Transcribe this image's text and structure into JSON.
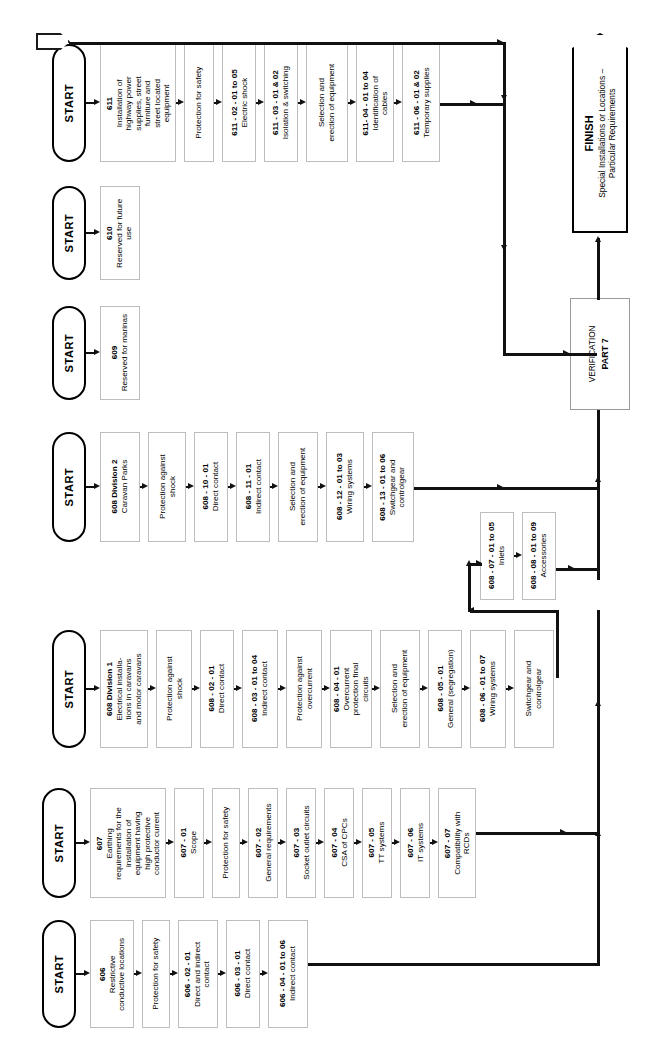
{
  "meta": {
    "start_label": "START"
  },
  "flag": {
    "label": ""
  },
  "finish": {
    "title": "FINISH",
    "subtitle": "Special Installations or Locations –\nParticular Requirements",
    "subtitle_line1": "Special Installations or Locations –",
    "subtitle_line2": "Particular Requirements"
  },
  "verification": {
    "line1": "VERIFICATION",
    "line2": "PART 7"
  },
  "rows": [
    {
      "id": "row-611",
      "start": "START",
      "boxes": [
        {
          "code": "611",
          "text": "Installation of\nhighway power\nsupplies, street\nfurniture and\nstreet located\nequipment",
          "lines": [
            "Installation of",
            "highway power",
            "supplies, street",
            "furniture and",
            "street located",
            "equipment"
          ]
        },
        {
          "code": "",
          "text": "Protection for safety",
          "lines": [
            "Protection for safety"
          ]
        },
        {
          "code": "611 - 02 - 01 to 05",
          "code_pre": "611 - 02 - 01",
          "code_mid": "to",
          "code_post": "05",
          "text": "Electric shock",
          "lines": [
            "Electric shock"
          ]
        },
        {
          "code": "611 - 03 - 01 & 02",
          "text": "Isolation & switching",
          "lines": [
            "Isolation & switching"
          ]
        },
        {
          "code": "",
          "text": "Selection and\nerection of equipment",
          "lines": [
            "Selection and",
            "erection of equipment"
          ]
        },
        {
          "code": "611- 04 - 01 to 04",
          "code_pre": "611- 04 - 01",
          "code_mid": "to",
          "code_post": "04",
          "text": "Identification of\ncables",
          "lines": [
            "Identification of",
            "cables"
          ]
        },
        {
          "code": "611 - 06 - 01 & 02",
          "text": "Temporary supplies",
          "lines": [
            "Temporary supplies"
          ]
        }
      ]
    },
    {
      "id": "row-610",
      "start": "START",
      "boxes": [
        {
          "code": "610",
          "text": "Reserved for future\nuse",
          "lines": [
            "Reserved for future",
            "use"
          ]
        }
      ]
    },
    {
      "id": "row-609",
      "start": "START",
      "boxes": [
        {
          "code": "609",
          "text": "Reserved for marinas",
          "lines": [
            "Reserved for marinas"
          ]
        }
      ]
    },
    {
      "id": "row-608-div2",
      "start": "START",
      "boxes": [
        {
          "code": "608 Division 2",
          "text": "Caravan Parks",
          "lines": [
            "Caravan Parks"
          ]
        },
        {
          "code": "",
          "text": "Protection against\nshock",
          "lines": [
            "Protection against",
            "shock"
          ]
        },
        {
          "code": "608 - 10 - 01",
          "text": "Direct contact",
          "lines": [
            "Direct contact"
          ]
        },
        {
          "code": "608 - 11 - 01",
          "text": "Indirect contact",
          "lines": [
            "Indirect contact"
          ]
        },
        {
          "code": "",
          "text": "Selection and\nerection of equipment",
          "lines": [
            "Selection and",
            "erection of equipment"
          ]
        },
        {
          "code": "608 - 12 - 01 to 03",
          "code_pre": "608 - 12 - 01",
          "code_mid": "to",
          "code_post": "03",
          "text": "Wiring systems",
          "lines": [
            "Wiring systems"
          ]
        },
        {
          "code": "608 - 13 - 01 to 06",
          "code_pre": "608 - 13 - 01",
          "code_mid": "to",
          "code_post": "06",
          "text": "Switchgear and\ncontrolgear",
          "lines": [
            "Switchgear and",
            "controlgear"
          ]
        }
      ]
    },
    {
      "id": "row-608-sub",
      "start": "",
      "boxes": [
        {
          "code": "608 - 07 - 01 to 05",
          "code_pre": "608 - 07 - 01",
          "code_mid": "to",
          "code_post": "05",
          "text": "Inlets",
          "lines": [
            "Inlets"
          ]
        },
        {
          "code": "608 - 08 - 01 to 09",
          "code_pre": "608 - 08 - 01",
          "code_mid": "to",
          "code_post": "09",
          "text": "Accessories",
          "lines": [
            "Accessories"
          ]
        }
      ]
    },
    {
      "id": "row-608-div1",
      "start": "START",
      "boxes": [
        {
          "code": "608 Division 1",
          "text": "Electrical installa-\ntions in caravans\nand motor caravans",
          "lines": [
            "Electrical installa-",
            "tions in caravans",
            "and motor caravans"
          ]
        },
        {
          "code": "",
          "text": "Protection against\nshock",
          "lines": [
            "Protection against",
            "shock"
          ]
        },
        {
          "code": "608 - 02 - 01",
          "text": "Direct contact",
          "lines": [
            "Direct contact"
          ]
        },
        {
          "code": "608 - 03 - 01 to 04",
          "code_pre": "608 - 03 - 01",
          "code_mid": "to",
          "code_post": "04",
          "text": "Indirect contact",
          "lines": [
            "Indirect contact"
          ]
        },
        {
          "code": "",
          "text": "Protection against\novercurrent",
          "lines": [
            "Protection against",
            "overcurrent"
          ]
        },
        {
          "code": "608 - 04 - 01",
          "text": "Overcurrent\nprotection final\ncircuits",
          "lines": [
            "Overcurrent",
            "protection final",
            "circuits"
          ]
        },
        {
          "code": "",
          "text": "Selection and\nerection of equipment",
          "lines": [
            "Selection and",
            "erection of equipment"
          ]
        },
        {
          "code": "608 - 05 - 01",
          "text": "General (segregation)",
          "lines": [
            "General (segregation)"
          ]
        },
        {
          "code": "608 - 06 - 01 to 07",
          "code_pre": "608 - 06 - 01",
          "code_mid": "to",
          "code_post": "07",
          "text": "Wiring systems",
          "lines": [
            "Wiring systems"
          ]
        },
        {
          "code": "",
          "text": "Switchgear and\ncontrolgear",
          "lines": [
            "Switchgear and",
            "controlgear"
          ]
        }
      ]
    },
    {
      "id": "row-607",
      "start": "START",
      "boxes": [
        {
          "code": "607",
          "text": "Earthing\nrequirements for the\ninstallation of\nequipment having\nhigh protective\nconductor current",
          "lines": [
            "Earthing",
            "requirements for the",
            "installation of",
            "equipment having",
            "high protective",
            "conductor current"
          ]
        },
        {
          "code": "607 - 01",
          "text": "Scope",
          "lines": [
            "Scope"
          ]
        },
        {
          "code": "",
          "text": "Protection for safety",
          "lines": [
            "Protection for safety"
          ]
        },
        {
          "code": "607 - 02",
          "text": "General requirements",
          "lines": [
            "General requirements"
          ]
        },
        {
          "code": "607 - 03",
          "text": "Socket outlet circuits",
          "lines": [
            "Socket outlet circuits"
          ]
        },
        {
          "code": "607 - 04",
          "text": "CSA of CPCs",
          "lines": [
            "CSA of CPCs"
          ]
        },
        {
          "code": "607 - 05",
          "text": "TT systems",
          "lines": [
            "TT systems"
          ]
        },
        {
          "code": "607 - 06",
          "text": "IT systems",
          "lines": [
            "IT systems"
          ]
        },
        {
          "code": "607 - 07",
          "text": "Compatibility with\nRCDs",
          "lines": [
            "Compatibility with",
            "RCDs"
          ]
        }
      ]
    },
    {
      "id": "row-606",
      "start": "START",
      "boxes": [
        {
          "code": "606",
          "text": "Restrictive\nconductive locations",
          "lines": [
            "Restrictive",
            "conductive locations"
          ]
        },
        {
          "code": "",
          "text": "Protection for safety",
          "lines": [
            "Protection for safety"
          ]
        },
        {
          "code": "606 - 02 - 01",
          "text": "Direct and indirect\ncontact",
          "lines": [
            "Direct and indirect",
            "contact"
          ]
        },
        {
          "code": "606 - 03 - 01",
          "text": "Direct contact",
          "lines": [
            "Direct contact"
          ]
        },
        {
          "code": "606 - 04 - 01 to 06",
          "code_pre": "606 - 04 - 01",
          "code_mid": "to",
          "code_post": "06",
          "text": "Indirect contact",
          "lines": [
            "Indirect contact"
          ]
        }
      ]
    }
  ],
  "colors": {
    "line": "#111111",
    "box_border": "#bdbdbd",
    "terminator_border": "#000000",
    "background": "#ffffff"
  }
}
